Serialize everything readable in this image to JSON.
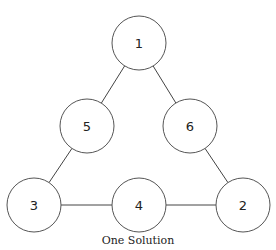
{
  "diagram": {
    "radius": 27,
    "nodes": [
      {
        "id": "n1",
        "label": "1",
        "cx": 139,
        "cy": 43
      },
      {
        "id": "n5",
        "label": "5",
        "cx": 87,
        "cy": 126
      },
      {
        "id": "n6",
        "label": "6",
        "cx": 190,
        "cy": 126
      },
      {
        "id": "n3",
        "label": "3",
        "cx": 34,
        "cy": 205
      },
      {
        "id": "n4",
        "label": "4",
        "cx": 139,
        "cy": 205
      },
      {
        "id": "n2",
        "label": "2",
        "cx": 243,
        "cy": 205
      }
    ],
    "edges": [
      [
        "n1",
        "n5"
      ],
      [
        "n1",
        "n6"
      ],
      [
        "n5",
        "n3"
      ],
      [
        "n6",
        "n2"
      ],
      [
        "n3",
        "n4"
      ],
      [
        "n4",
        "n2"
      ]
    ],
    "caption": "One Solution"
  }
}
